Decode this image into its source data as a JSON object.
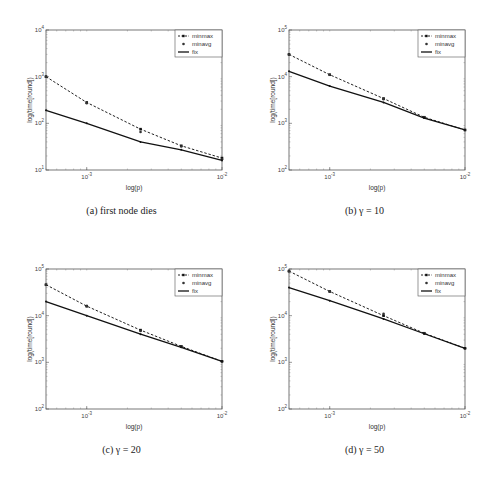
{
  "chart_data": [
    {
      "type": "line",
      "caption": "(a) first node dies",
      "xlabel": "log(p)",
      "ylabel": "log(time[round])",
      "xscale": "log",
      "yscale": "log",
      "xlim": [
        0.0005,
        0.01
      ],
      "ylim": [
        10,
        10000
      ],
      "xticks": [
        {
          "value": 0.001,
          "label": "10^-3"
        },
        {
          "value": 0.01,
          "label": "10^-2"
        }
      ],
      "yticks": [
        {
          "value": 10,
          "label": "10^1"
        },
        {
          "value": 100,
          "label": "10^2"
        },
        {
          "value": 1000,
          "label": "10^3"
        },
        {
          "value": 10000,
          "label": "10^4"
        }
      ],
      "legend": {
        "position": "upper right",
        "entries": [
          "minmax",
          "minavg",
          "fix"
        ]
      },
      "grid": false,
      "x": [
        0.0005,
        0.001,
        0.0025,
        0.005,
        0.01
      ],
      "series": [
        {
          "name": "minmax",
          "style": "dashed-marker",
          "values": [
            1000,
            280,
            75,
            33,
            18
          ]
        },
        {
          "name": "minavg",
          "style": "marker-only",
          "values": [
            1000,
            270,
            65,
            32,
            17
          ]
        },
        {
          "name": "fix",
          "style": "solid",
          "values": [
            190,
            100,
            40,
            27,
            16
          ]
        }
      ]
    },
    {
      "type": "line",
      "caption": "(b) γ = 10",
      "xlabel": "log(p)",
      "ylabel": "log(time[round])",
      "xscale": "log",
      "yscale": "log",
      "xlim": [
        0.0005,
        0.01
      ],
      "ylim": [
        100,
        100000
      ],
      "xticks": [
        {
          "value": 0.001,
          "label": "10^-3"
        },
        {
          "value": 0.01,
          "label": "10^-2"
        }
      ],
      "yticks": [
        {
          "value": 100,
          "label": "10^2"
        },
        {
          "value": 1000,
          "label": "10^3"
        },
        {
          "value": 10000,
          "label": "10^4"
        },
        {
          "value": 100000,
          "label": "10^5"
        }
      ],
      "legend": {
        "position": "upper right",
        "entries": [
          "minmax",
          "minavg",
          "fix"
        ]
      },
      "grid": false,
      "x": [
        0.0005,
        0.001,
        0.0025,
        0.005,
        0.01
      ],
      "series": [
        {
          "name": "minmax",
          "style": "dashed-marker",
          "values": [
            30000,
            11000,
            3400,
            1350,
            720
          ]
        },
        {
          "name": "minavg",
          "style": "marker-only",
          "values": [
            30000,
            11000,
            3300,
            1350,
            720
          ]
        },
        {
          "name": "fix",
          "style": "solid",
          "values": [
            13000,
            6300,
            2800,
            1300,
            720
          ]
        }
      ]
    },
    {
      "type": "line",
      "caption": "(c) γ = 20",
      "xlabel": "log(p)",
      "ylabel": "log(time[round])",
      "xscale": "log",
      "yscale": "log",
      "xlim": [
        0.0005,
        0.01
      ],
      "ylim": [
        100,
        100000
      ],
      "xticks": [
        {
          "value": 0.001,
          "label": "10^-3"
        },
        {
          "value": 0.01,
          "label": "10^-2"
        }
      ],
      "yticks": [
        {
          "value": 100,
          "label": "10^2"
        },
        {
          "value": 1000,
          "label": "10^3"
        },
        {
          "value": 10000,
          "label": "10^4"
        },
        {
          "value": 100000,
          "label": "10^5"
        }
      ],
      "legend": {
        "position": "upper right",
        "entries": [
          "minmax",
          "minavg",
          "fix"
        ]
      },
      "grid": false,
      "x": [
        0.0005,
        0.001,
        0.0025,
        0.005,
        0.01
      ],
      "series": [
        {
          "name": "minmax",
          "style": "dashed-marker",
          "values": [
            46000,
            16000,
            4900,
            2200,
            1050
          ]
        },
        {
          "name": "minavg",
          "style": "marker-only",
          "values": [
            46000,
            16000,
            4700,
            2200,
            1050
          ]
        },
        {
          "name": "fix",
          "style": "solid",
          "values": [
            20000,
            10000,
            4000,
            2100,
            1050
          ]
        }
      ]
    },
    {
      "type": "line",
      "caption": "(d) γ = 50",
      "xlabel": "log(p)",
      "ylabel": "log(time[round])",
      "xscale": "log",
      "yscale": "log",
      "xlim": [
        0.0005,
        0.01
      ],
      "ylim": [
        100,
        100000
      ],
      "xticks": [
        {
          "value": 0.001,
          "label": "10^-3"
        },
        {
          "value": 0.01,
          "label": "10^-2"
        }
      ],
      "yticks": [
        {
          "value": 100,
          "label": "10^2"
        },
        {
          "value": 1000,
          "label": "10^3"
        },
        {
          "value": 10000,
          "label": "10^4"
        },
        {
          "value": 100000,
          "label": "10^5"
        }
      ],
      "legend": {
        "position": "upper right",
        "entries": [
          "minmax",
          "minavg",
          "fix"
        ]
      },
      "grid": false,
      "x": [
        0.0005,
        0.001,
        0.0025,
        0.005,
        0.01
      ],
      "series": [
        {
          "name": "minmax",
          "style": "dashed-marker",
          "values": [
            90000,
            33000,
            10000,
            4200,
            2000
          ]
        },
        {
          "name": "minavg",
          "style": "marker-only",
          "values": [
            90000,
            33000,
            11000,
            4200,
            2000
          ]
        },
        {
          "name": "fix",
          "style": "solid",
          "values": [
            40000,
            21000,
            8500,
            4100,
            2000
          ]
        }
      ]
    }
  ],
  "captions": {
    "a": "(a) first node dies",
    "b": "(b) γ = 10",
    "c": "(c) γ = 20",
    "d": "(d) γ = 50"
  }
}
